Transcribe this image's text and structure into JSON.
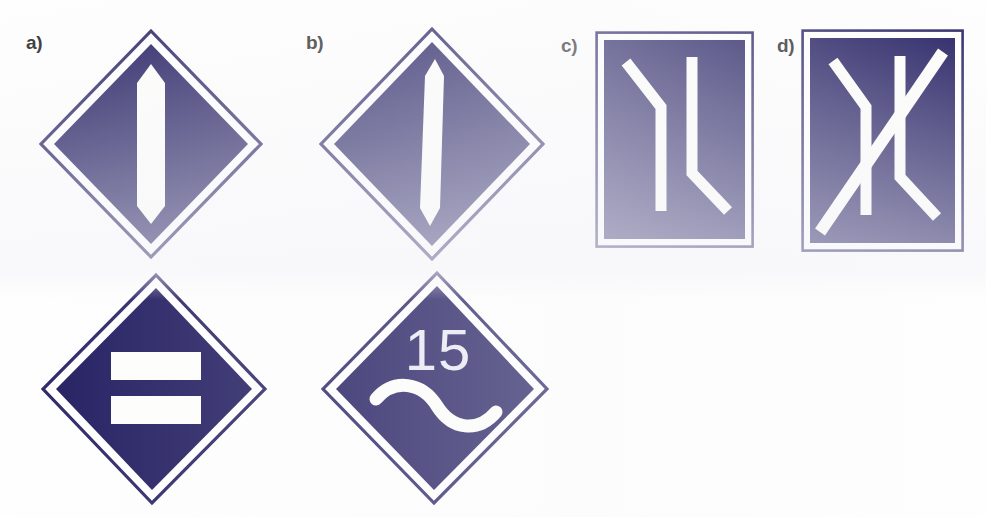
{
  "figure": {
    "type": "road-sign-plate-illustration",
    "background_color": "#ffffff",
    "panel_fill_color": "#221d60",
    "panel_border_color": "#2b2566",
    "marking_color": "#fdfdfb",
    "label_color": "#2b2b2b"
  },
  "labels": {
    "a": "a)",
    "b": "b)",
    "c": "c)",
    "d": "d)"
  },
  "signs": [
    {
      "id": "sign-a-top",
      "label_ref": "a",
      "shape": "diamond",
      "row": "top",
      "marking": "single-vertical-bar-pointed-ends",
      "text": ""
    },
    {
      "id": "sign-a-bottom",
      "label_ref": "a",
      "shape": "diamond",
      "row": "bottom",
      "marking": "two-horizontal-bars",
      "text": ""
    },
    {
      "id": "sign-b-top",
      "label_ref": "b",
      "shape": "diamond",
      "row": "top",
      "marking": "single-narrow-vertical-bar-pointed-ends",
      "text": ""
    },
    {
      "id": "sign-b-bottom",
      "label_ref": "b",
      "shape": "diamond",
      "row": "bottom",
      "marking": "s-curve-wave",
      "text": "15"
    },
    {
      "id": "sign-c",
      "label_ref": "c",
      "shape": "rectangle",
      "row": "top",
      "marking": "two-bent-lane-lines",
      "text": ""
    },
    {
      "id": "sign-d",
      "label_ref": "d",
      "shape": "rectangle",
      "row": "top",
      "marking": "two-bent-lane-lines-plus-diagonal",
      "text": ""
    }
  ],
  "sign_texts": {
    "speed_value": "15"
  }
}
